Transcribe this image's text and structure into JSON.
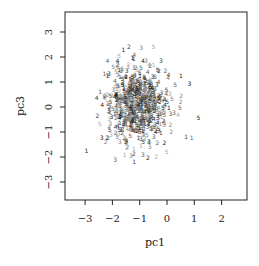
{
  "chart_data": {
    "type": "scatter",
    "title": "",
    "xlabel": "pc1",
    "ylabel": "pc3",
    "xlim": [
      -3.8,
      2.9
    ],
    "ylim": [
      -3.7,
      3.8
    ],
    "xticks": [
      "-3",
      "-2",
      "-1",
      "0",
      "1",
      "2"
    ],
    "yticks": [
      "-3",
      "-2",
      "-1",
      "0",
      "1",
      "2",
      "3"
    ],
    "grid": false,
    "legend": null,
    "marker": "digit labels (group ids 1-5) in gray shades",
    "groups": [
      "1",
      "2",
      "3",
      "4",
      "5"
    ],
    "point_colors": [
      "#1a1a1a",
      "#3a3a3a",
      "#5c5c5c",
      "#808080",
      "#a8a8a8"
    ],
    "cloud_center": {
      "pc1": -1.1,
      "pc3": 0.1
    },
    "cloud_spread": {
      "pc1_sd": 0.6,
      "pc3_sd": 0.8
    },
    "n_points_approx": 700,
    "points": [
      {
        "x": -2.95,
        "y": -1.75,
        "label": "1"
      },
      {
        "x": -2.55,
        "y": -0.35,
        "label": "2"
      },
      {
        "x": -2.45,
        "y": 0.6,
        "label": "1"
      },
      {
        "x": -2.15,
        "y": 1.25,
        "label": "2"
      },
      {
        "x": -1.85,
        "y": 1.55,
        "label": "3"
      },
      {
        "x": -1.6,
        "y": 2.3,
        "label": "1"
      },
      {
        "x": -1.4,
        "y": 2.4,
        "label": "2"
      },
      {
        "x": -1.2,
        "y": 2.1,
        "label": "4"
      },
      {
        "x": -0.95,
        "y": 2.35,
        "label": "3"
      },
      {
        "x": -0.5,
        "y": 2.4,
        "label": "5"
      },
      {
        "x": -0.3,
        "y": 1.45,
        "label": "2"
      },
      {
        "x": 0.05,
        "y": 1.3,
        "label": "4"
      },
      {
        "x": 0.3,
        "y": 0.9,
        "label": "5"
      },
      {
        "x": 0.5,
        "y": 0.2,
        "label": "2"
      },
      {
        "x": 0.4,
        "y": -0.3,
        "label": "4"
      },
      {
        "x": 1.15,
        "y": -0.45,
        "label": "5"
      },
      {
        "x": 0.7,
        "y": -1.2,
        "label": "1"
      },
      {
        "x": 0.9,
        "y": -1.25,
        "label": "1"
      },
      {
        "x": 0.15,
        "y": -1.0,
        "label": "2"
      },
      {
        "x": -0.4,
        "y": -2.0,
        "label": "2"
      },
      {
        "x": -0.7,
        "y": -2.05,
        "label": "2"
      },
      {
        "x": -1.2,
        "y": -2.2,
        "label": "1"
      },
      {
        "x": -1.9,
        "y": -2.1,
        "label": "3"
      },
      {
        "x": -2.25,
        "y": -1.4,
        "label": "2"
      },
      {
        "x": -1.55,
        "y": -1.9,
        "label": "1"
      },
      {
        "x": -0.1,
        "y": -1.45,
        "label": "2"
      },
      {
        "x": -2.1,
        "y": -0.9,
        "label": "5"
      },
      {
        "x": -0.2,
        "y": 0.55,
        "label": "3"
      }
    ]
  },
  "random_cloud": {
    "seed": 42,
    "count": 640,
    "center_x": -1.1,
    "center_y": 0.1,
    "sd_x": 0.55,
    "sd_y": 0.75
  }
}
